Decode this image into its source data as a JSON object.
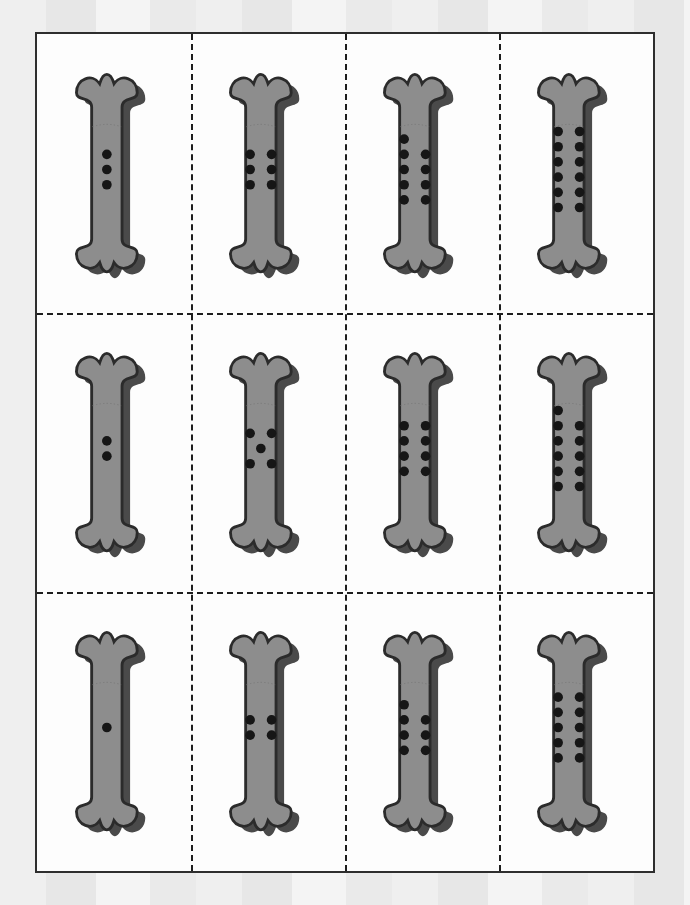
{
  "document": {
    "kind": "printable-worksheet",
    "theme": "dog-bone-counting-cards",
    "sheet": {
      "columns": 4,
      "rows": 3,
      "total_cards": 12
    },
    "colors": {
      "paper": "#fdfdfd",
      "page_border": "#2e2e2e",
      "cut_line": "#1d1d1d",
      "bone_fill": "#8d8d8d",
      "bone_shadow": "#4a4a4a",
      "bone_outline": "#2b2b2b",
      "dot": "#161616",
      "backdrop": "#efefef"
    }
  },
  "cut_guides": {
    "vertical_positions_pct": [
      25,
      50,
      75
    ],
    "horizontal_positions_pct": [
      33.333,
      66.666
    ],
    "style": "dashed"
  },
  "cards": [
    {
      "id": "card-r1c1",
      "row": 1,
      "col": 1,
      "dot_count": 3,
      "dot_layout": "column",
      "dots": [
        [
          0,
          0
        ],
        [
          0,
          1
        ],
        [
          0,
          2
        ]
      ]
    },
    {
      "id": "card-r1c2",
      "row": 1,
      "col": 2,
      "dot_count": 6,
      "dot_layout": "pairs",
      "dots": [
        [
          0,
          0
        ],
        [
          1,
          0
        ],
        [
          0,
          1
        ],
        [
          1,
          1
        ],
        [
          0,
          2
        ],
        [
          1,
          2
        ]
      ]
    },
    {
      "id": "card-r1c3",
      "row": 1,
      "col": 3,
      "dot_count": 9,
      "dot_layout": "one-plus-pairs",
      "dots": [
        [
          0,
          0
        ],
        [
          0,
          1
        ],
        [
          1,
          1
        ],
        [
          0,
          2
        ],
        [
          1,
          2
        ],
        [
          0,
          3
        ],
        [
          1,
          3
        ],
        [
          0,
          4
        ],
        [
          1,
          4
        ]
      ]
    },
    {
      "id": "card-r1c4",
      "row": 1,
      "col": 4,
      "dot_count": 12,
      "dot_layout": "pairs",
      "dots": [
        [
          0,
          0
        ],
        [
          1,
          0
        ],
        [
          0,
          1
        ],
        [
          1,
          1
        ],
        [
          0,
          2
        ],
        [
          1,
          2
        ],
        [
          0,
          3
        ],
        [
          1,
          3
        ],
        [
          0,
          4
        ],
        [
          1,
          4
        ],
        [
          0,
          5
        ],
        [
          1,
          5
        ]
      ]
    },
    {
      "id": "card-r2c1",
      "row": 2,
      "col": 1,
      "dot_count": 2,
      "dot_layout": "column",
      "dots": [
        [
          0,
          0
        ],
        [
          0,
          1
        ]
      ]
    },
    {
      "id": "card-r2c2",
      "row": 2,
      "col": 2,
      "dot_count": 5,
      "dot_layout": "quincunx",
      "dots": [
        [
          0,
          0
        ],
        [
          1,
          0
        ],
        [
          0.5,
          1
        ],
        [
          0,
          2
        ],
        [
          1,
          2
        ]
      ]
    },
    {
      "id": "card-r2c3",
      "row": 2,
      "col": 3,
      "dot_count": 8,
      "dot_layout": "pairs",
      "dots": [
        [
          0,
          0
        ],
        [
          1,
          0
        ],
        [
          0,
          1
        ],
        [
          1,
          1
        ],
        [
          0,
          2
        ],
        [
          1,
          2
        ],
        [
          0,
          3
        ],
        [
          1,
          3
        ]
      ]
    },
    {
      "id": "card-r2c4",
      "row": 2,
      "col": 4,
      "dot_count": 11,
      "dot_layout": "one-plus-pairs",
      "dots": [
        [
          0,
          0
        ],
        [
          0,
          1
        ],
        [
          1,
          1
        ],
        [
          0,
          2
        ],
        [
          1,
          2
        ],
        [
          0,
          3
        ],
        [
          1,
          3
        ],
        [
          0,
          4
        ],
        [
          1,
          4
        ],
        [
          0,
          5
        ],
        [
          1,
          5
        ]
      ]
    },
    {
      "id": "card-r3c1",
      "row": 3,
      "col": 1,
      "dot_count": 1,
      "dot_layout": "single",
      "dots": [
        [
          0,
          0
        ]
      ]
    },
    {
      "id": "card-r3c2",
      "row": 3,
      "col": 2,
      "dot_count": 4,
      "dot_layout": "square",
      "dots": [
        [
          0,
          0
        ],
        [
          1,
          0
        ],
        [
          0,
          1
        ],
        [
          1,
          1
        ]
      ]
    },
    {
      "id": "card-r3c3",
      "row": 3,
      "col": 3,
      "dot_count": 7,
      "dot_layout": "one-plus-pairs",
      "dots": [
        [
          0,
          0
        ],
        [
          0,
          1
        ],
        [
          1,
          1
        ],
        [
          0,
          2
        ],
        [
          1,
          2
        ],
        [
          0,
          3
        ],
        [
          1,
          3
        ]
      ]
    },
    {
      "id": "card-r3c4",
      "row": 3,
      "col": 4,
      "dot_count": 10,
      "dot_layout": "pairs",
      "dots": [
        [
          0,
          0
        ],
        [
          1,
          0
        ],
        [
          0,
          1
        ],
        [
          1,
          1
        ],
        [
          0,
          2
        ],
        [
          1,
          2
        ],
        [
          0,
          3
        ],
        [
          1,
          3
        ],
        [
          0,
          4
        ],
        [
          1,
          4
        ]
      ]
    }
  ],
  "sequences": {
    "row_1": [
      3,
      6,
      9,
      12
    ],
    "row_2": [
      2,
      5,
      8,
      11
    ],
    "row_3": [
      1,
      4,
      7,
      10
    ]
  }
}
